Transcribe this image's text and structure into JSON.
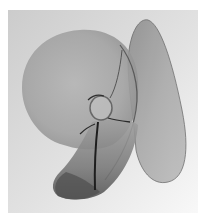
{
  "image": {
    "description": "Grayscale photograph of a translucent curved-surface sculpture with a large round lobe, a tall right fin, a lower curled band and a small central ring with a dark stem",
    "colors": {
      "background_top_left": "#cfcfcf",
      "background_bottom_right": "#f7f7f7",
      "margin": "#ffffff",
      "surface_light": "#a9a9a9",
      "surface_mid": "#8c8c8c",
      "surface_dark": "#5a5a5a",
      "edge_dark": "#3c3c3c",
      "stem": "#1e1e1e"
    }
  }
}
